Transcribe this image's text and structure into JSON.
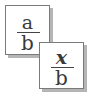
{
  "icon": {
    "name": "fraction-substitute-icon",
    "fractions": [
      {
        "numerator": "a",
        "denominator": "b",
        "numerator_style": "regular"
      },
      {
        "numerator": "x",
        "denominator": "b",
        "numerator_style": "bold-italic"
      }
    ],
    "colors": {
      "border": "#7a7a7a",
      "shadow": "#b5b5b5",
      "text": "#3a3a3a",
      "background": "#ffffff"
    }
  }
}
